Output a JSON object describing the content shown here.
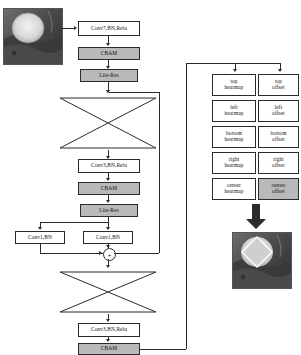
{
  "diagram": {
    "colors": {
      "shaded_fill": "#b9b9b9",
      "box_fill": "#ffffff",
      "stroke": "#2b2b2b"
    }
  },
  "input_image": {
    "name": "input-grayscale-image",
    "description": "grayscale scan with bright circular region"
  },
  "output_image": {
    "name": "output-detection-image",
    "description": "grayscale scan with rotated square detection overlay"
  },
  "backbone": {
    "conv7": "Conv7,BN,Relu",
    "cbam_top": "CBAM",
    "lite_res_top": "Lite-Res",
    "hourglass_top": "hourglass-downsample-upsample",
    "conv3_mid": "Conv3,BN,Relu",
    "cbam_mid": "CBAM",
    "lite_res_mid": "Lite-Res",
    "conv1_left": "Conv1,BN",
    "conv1_right": "Conv1,BN",
    "sum_symbol": "+",
    "hourglass_bottom": "hourglass-downsample-upsample",
    "conv3_bottom": "Conv3,BN,Relu",
    "cbam_bottom": "CBAM"
  },
  "head": {
    "rows": [
      {
        "heatmap": "top\nheatmap",
        "offset": "top\noffset"
      },
      {
        "heatmap": "left\nheatmap",
        "offset": "left\noffset"
      },
      {
        "heatmap": "bottom\nheatmap",
        "offset": "bottom\noffset"
      },
      {
        "heatmap": "right\nheatmap",
        "offset": "right\noffset"
      },
      {
        "heatmap": "center\nheatmap",
        "offset": "center\noffset"
      }
    ],
    "branches": [
      {
        "line1": "top",
        "line2": "heatmap",
        "shaded": false
      },
      {
        "line1": "top",
        "line2": "offset",
        "shaded": false
      },
      {
        "line1": "left",
        "line2": "heatmap",
        "shaded": false
      },
      {
        "line1": "left",
        "line2": "offset",
        "shaded": false
      },
      {
        "line1": "bottom",
        "line2": "heatmap",
        "shaded": false
      },
      {
        "line1": "bottom",
        "line2": "offset",
        "shaded": false
      },
      {
        "line1": "right",
        "line2": "heatmap",
        "shaded": false
      },
      {
        "line1": "right",
        "line2": "offset",
        "shaded": false
      },
      {
        "line1": "center",
        "line2": "heatmap",
        "shaded": false
      },
      {
        "line1": "center",
        "line2": "offset",
        "shaded": true
      }
    ]
  }
}
